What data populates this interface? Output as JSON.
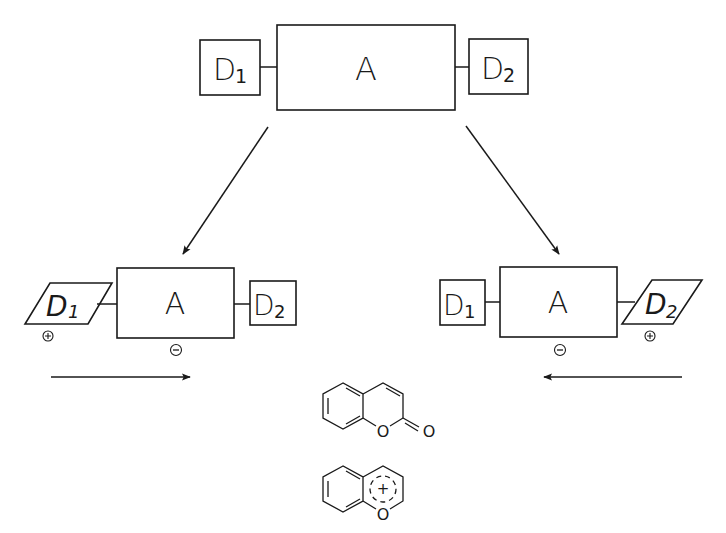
{
  "top": {
    "donor_left": {
      "label": "D",
      "sub": "1"
    },
    "acceptor": {
      "label": "A"
    },
    "donor_right": {
      "label": "D",
      "sub": "2"
    }
  },
  "bottom_left": {
    "donor_excited": {
      "label": "D",
      "sub": "1",
      "charge": "+"
    },
    "acceptor": {
      "label": "A",
      "charge": "−"
    },
    "donor_ground": {
      "label": "D",
      "sub": "2"
    },
    "transfer_direction": "right"
  },
  "bottom_right": {
    "donor_ground": {
      "label": "D",
      "sub": "1"
    },
    "acceptor": {
      "label": "A",
      "charge": "−"
    },
    "donor_excited": {
      "label": "D",
      "sub": "2",
      "charge": "+"
    },
    "transfer_direction": "left"
  },
  "structures": {
    "coumarin": {
      "heteroatom": "O",
      "carbonyl": "O"
    },
    "benzopyrylium": {
      "heteroatom": "O",
      "charge": "+"
    }
  },
  "colors": {
    "ink": "#1a1a1a",
    "background": "#ffffff"
  }
}
